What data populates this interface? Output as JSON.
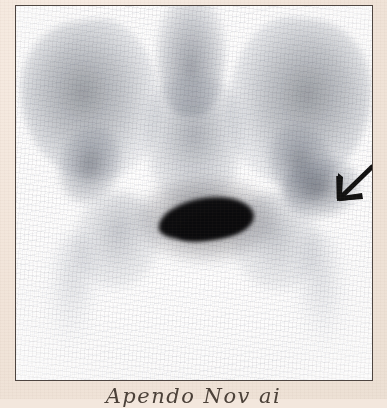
{
  "document": {
    "type": "bone-scintigram-print",
    "paper_color": "#f3e7dd",
    "frame_border_color": "#4c4440",
    "film_background": "#ffffff"
  },
  "figure": {
    "modality": "Nuclear medicine bone scan (scintigram)",
    "body_region": "Pelvis - anterior view",
    "frame": {
      "x": 15,
      "y": 5,
      "width": 358,
      "height": 376
    }
  },
  "annotations": {
    "arrow": {
      "name": "pointer-arrow",
      "direction": "down-left",
      "color": "#111111",
      "target": "focal increased uptake, left iliac bone / sacroiliac region",
      "x": 300,
      "y": 150
    }
  },
  "caption": {
    "text": "Apendo Nov ai",
    "note": "handwritten, cropped by lower image edge"
  },
  "anatomy": [
    {
      "name": "right-iliac-wing",
      "uptake": "moderate"
    },
    {
      "name": "left-iliac-wing",
      "uptake": "moderate"
    },
    {
      "name": "lumbar-spine",
      "uptake": "moderate"
    },
    {
      "name": "sacrum",
      "uptake": "moderate"
    },
    {
      "name": "right-sacroiliac-joint",
      "uptake": "moderate"
    },
    {
      "name": "left-sacroiliac-joint",
      "uptake": "moderate"
    },
    {
      "name": "lesion-focus-left-ilium",
      "uptake": "increased"
    },
    {
      "name": "right-ischium",
      "uptake": "mild"
    },
    {
      "name": "left-ischium",
      "uptake": "mild"
    },
    {
      "name": "right-femur",
      "uptake": "faint"
    },
    {
      "name": "left-femur",
      "uptake": "faint"
    },
    {
      "name": "urinary-bladder",
      "uptake": "intense"
    }
  ]
}
